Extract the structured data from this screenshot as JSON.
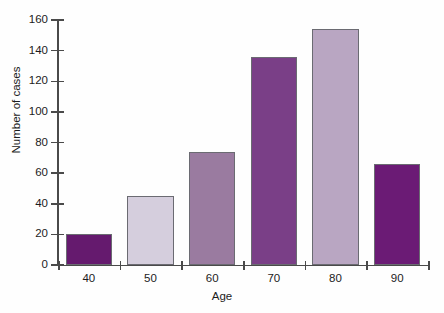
{
  "chart_data": {
    "type": "bar",
    "title": "",
    "xlabel": "Age",
    "ylabel": "Number of cases",
    "categories": [
      "40",
      "50",
      "60",
      "70",
      "80",
      "90"
    ],
    "values": [
      20,
      45,
      74,
      136,
      154,
      66
    ],
    "ylim": [
      0,
      160
    ],
    "ytick_labels": [
      "0",
      "20",
      "40",
      "60",
      "80",
      "100",
      "120",
      "140",
      "160"
    ],
    "ytick_values": [
      0,
      20,
      40,
      60,
      80,
      100,
      120,
      140,
      160
    ],
    "grid": false,
    "legend": "none",
    "bar_colors": [
      "#651a6e",
      "#d5cedd",
      "#9a7ba0",
      "#7a3f87",
      "#b9a6c2",
      "#6b1b75"
    ],
    "bar_border_color": "#6b6b72",
    "axis_color": "#4a4a4a",
    "background": "#fefefe"
  }
}
